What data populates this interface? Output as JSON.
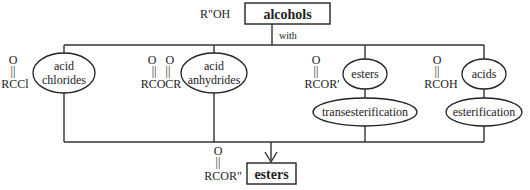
{
  "diagram": {
    "source": {
      "label": "alcohols",
      "formula": "R\"OH",
      "connector_label": "with"
    },
    "reagents": [
      {
        "name_line1": "acid",
        "name_line2": "chlorides",
        "formula_o": "O",
        "formula_bond": "||",
        "formula": "RCCl"
      },
      {
        "name_line1": "acid",
        "name_line2": "anhydrides",
        "formula_o": "O   O",
        "formula_bond": "||   ||",
        "formula": "RCOCR"
      },
      {
        "name_line1": "esters",
        "formula_o": "O",
        "formula_bond": "||",
        "formula": "RCOR'",
        "process": "transesterification"
      },
      {
        "name_line1": "acids",
        "formula_o": "O",
        "formula_bond": "||",
        "formula": "RCOH",
        "process": "esterification"
      }
    ],
    "product": {
      "label": "esters",
      "formula_o": "O",
      "formula_bond": "||",
      "formula": "RCOR\""
    }
  }
}
